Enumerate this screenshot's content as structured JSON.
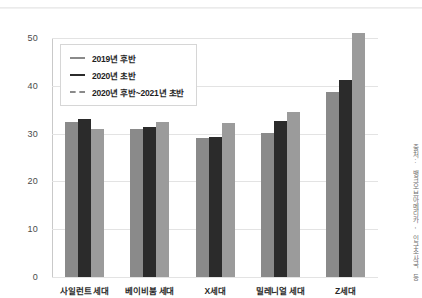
{
  "chart_data": {
    "type": "bar",
    "title": "",
    "subtitle": "",
    "xlabel": "",
    "ylabel": "",
    "ylim": [
      0,
      50
    ],
    "yticks": [
      "0",
      "10",
      "20",
      "30",
      "40",
      "50"
    ],
    "grid": true,
    "legend_position": "upper-left",
    "categories": [
      "사일런트 세대",
      "베이비붐 세대",
      "X세대",
      "밀레니얼 세대",
      "Z세대"
    ],
    "series": [
      {
        "name": "2019년 후반",
        "color": "#8a8a8a",
        "values": [
          32.5,
          31.0,
          29.0,
          30.2,
          38.8
        ]
      },
      {
        "name": "2020년 초반",
        "color": "#2b2b2b",
        "values": [
          33.0,
          31.3,
          29.2,
          32.6,
          41.2
        ]
      },
      {
        "name": "2020년 후반~2021년 초반",
        "color": "#9b9b9b",
        "values": [
          31.0,
          32.5,
          32.3,
          34.5,
          51.0
        ]
      }
    ],
    "annotations": {
      "source": "출처: 뱅크오브아메리카, 인구조사국 등"
    }
  }
}
